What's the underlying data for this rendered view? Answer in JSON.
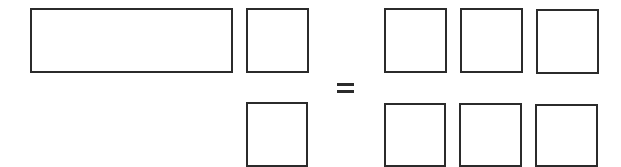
{
  "diagram": {
    "operator": "=",
    "stroke_color": "#2b2b2b",
    "left_group": {
      "boxes": [
        {
          "id": "long-rect",
          "x": 30,
          "y": 8,
          "w": 203,
          "h": 65
        },
        {
          "id": "small-top",
          "x": 246,
          "y": 8,
          "w": 63,
          "h": 65
        },
        {
          "id": "small-bottom",
          "x": 246,
          "y": 102,
          "w": 62,
          "h": 65
        }
      ]
    },
    "right_group": {
      "rows": 2,
      "cols": 3,
      "boxes": [
        {
          "x": 384,
          "y": 8,
          "w": 63,
          "h": 65
        },
        {
          "x": 460,
          "y": 8,
          "w": 63,
          "h": 65
        },
        {
          "x": 536,
          "y": 9,
          "w": 63,
          "h": 65
        },
        {
          "x": 384,
          "y": 103,
          "w": 62,
          "h": 64
        },
        {
          "x": 459,
          "y": 103,
          "w": 63,
          "h": 64
        },
        {
          "x": 535,
          "y": 104,
          "w": 63,
          "h": 63
        }
      ]
    }
  }
}
